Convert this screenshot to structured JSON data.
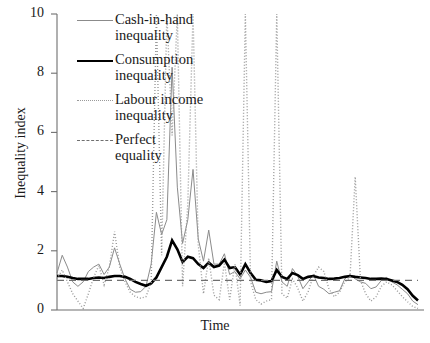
{
  "chart_data": {
    "type": "line",
    "title": "",
    "xlabel": "Time",
    "ylabel": "Inequality index",
    "ylim": [
      0,
      10
    ],
    "yticks": [
      0,
      2,
      4,
      6,
      8,
      10
    ],
    "ytick_labels": [
      "0",
      "2",
      "4",
      "6",
      "8",
      "10"
    ],
    "xticks": [],
    "xtick_labels": [],
    "grid": false,
    "legend_position": "upper-left-inside",
    "x": [
      0,
      1,
      2,
      3,
      4,
      5,
      6,
      7,
      8,
      9,
      10,
      11,
      12,
      13,
      14,
      15,
      16,
      17,
      18,
      19,
      20,
      21,
      22,
      23,
      24,
      25,
      26,
      27,
      28,
      29,
      30,
      31,
      32,
      33,
      34,
      35,
      36,
      37,
      38,
      39,
      40,
      41,
      42,
      43,
      44,
      45,
      46,
      47,
      48,
      49,
      50,
      51,
      52,
      53,
      54,
      55,
      56,
      57,
      58,
      59,
      60,
      61,
      62,
      63,
      64,
      65,
      66,
      67,
      68,
      69
    ],
    "series": [
      {
        "name": "Cash-in-hand inequality",
        "color": "#8b8b8b",
        "style": "solid",
        "width": 1.0,
        "values": [
          1.25,
          1.85,
          1.45,
          0.95,
          0.8,
          0.95,
          1.3,
          1.45,
          1.55,
          1.2,
          1.45,
          2.1,
          1.55,
          1.05,
          0.7,
          0.6,
          0.62,
          0.8,
          1.55,
          3.3,
          2.55,
          3.05,
          8.2,
          4.15,
          2.25,
          3.05,
          4.75,
          2.4,
          1.65,
          2.7,
          1.55,
          1.55,
          1.9,
          1.2,
          1.3,
          1.05,
          1.35,
          1.1,
          0.6,
          0.55,
          0.6,
          0.62,
          1.65,
          0.95,
          0.8,
          1.4,
          1.15,
          0.72,
          0.95,
          1.2,
          0.8,
          0.7,
          0.55,
          0.6,
          0.65,
          1.05,
          1.2,
          1.05,
          0.95,
          0.9,
          0.72,
          0.78,
          1.0,
          1.1,
          0.95,
          0.85,
          0.7,
          0.55,
          0.3,
          0.18
        ]
      },
      {
        "name": "Consumption inequality",
        "color": "#000000",
        "style": "solid",
        "width": 2.6,
        "values": [
          1.15,
          1.15,
          1.12,
          1.08,
          1.05,
          1.05,
          1.05,
          1.08,
          1.1,
          1.08,
          1.12,
          1.15,
          1.15,
          1.12,
          1.05,
          0.95,
          0.88,
          0.82,
          0.9,
          1.1,
          1.45,
          1.8,
          2.35,
          2.05,
          1.62,
          1.8,
          1.75,
          1.55,
          1.42,
          1.6,
          1.45,
          1.5,
          1.7,
          1.42,
          1.45,
          1.2,
          1.55,
          1.25,
          1.02,
          1.0,
          0.95,
          0.98,
          1.35,
          1.12,
          1.05,
          1.25,
          1.18,
          1.05,
          1.12,
          1.15,
          1.1,
          1.08,
          1.05,
          1.06,
          1.08,
          1.12,
          1.15,
          1.12,
          1.1,
          1.08,
          1.05,
          1.05,
          1.06,
          1.05,
          1.0,
          0.95,
          0.85,
          0.7,
          0.48,
          0.32
        ]
      },
      {
        "name": "Labour income inequality",
        "color": "#9a9a9a",
        "style": "dotted",
        "width": 1.4,
        "values": [
          1.05,
          1.35,
          0.95,
          0.55,
          0.3,
          0.05,
          0.55,
          1.1,
          1.5,
          0.85,
          1.45,
          2.65,
          1.45,
          0.95,
          0.6,
          0.45,
          0.4,
          0.45,
          0.92,
          10.0,
          1.85,
          10.0,
          5.9,
          10.0,
          0.8,
          3.6,
          10.0,
          2.2,
          0.55,
          1.75,
          0.5,
          0.35,
          1.6,
          0.35,
          1.55,
          0.15,
          10.0,
          0.95,
          0.35,
          0.2,
          0.3,
          0.35,
          10.0,
          0.55,
          0.4,
          1.05,
          0.75,
          0.3,
          0.62,
          1.15,
          1.45,
          1.3,
          0.7,
          0.45,
          0.6,
          0.95,
          1.1,
          4.5,
          1.0,
          0.55,
          0.3,
          0.45,
          0.8,
          0.95,
          0.85,
          0.65,
          0.45,
          0.28,
          0.12,
          0.05
        ]
      },
      {
        "name": "Perfect equality",
        "color": "#6f6f6f",
        "style": "dashed",
        "width": 1.4,
        "constant": 1.0
      }
    ]
  },
  "axes": {
    "ylabel": "Inequality index",
    "xlabel": "Time",
    "ytick_labels": [
      "10",
      "8",
      "6",
      "4",
      "2",
      "0"
    ]
  },
  "legend": {
    "items": [
      {
        "label": "Cash-in-hand\ninequality",
        "key": "solid-thin-gray-line-icon"
      },
      {
        "label": "Consumption\ninequality",
        "key": "solid-thick-black-line-icon"
      },
      {
        "label": "Labour income\ninequality",
        "key": "dotted-gray-line-icon"
      },
      {
        "label": "Perfect\nequality",
        "key": "dashed-gray-line-icon"
      }
    ]
  }
}
